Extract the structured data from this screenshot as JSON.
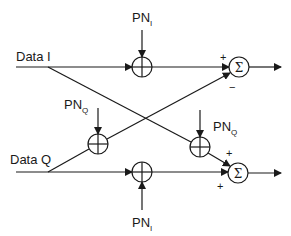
{
  "diagram": {
    "inputs": {
      "data_i": "Data I",
      "data_q": "Data Q"
    },
    "pn_labels": {
      "top_pn_i": {
        "main": "PN",
        "sub": "I"
      },
      "bottom_pn_i": {
        "main": "PN",
        "sub": "I"
      },
      "left_pn_q": {
        "main": "PN",
        "sub": "Q"
      },
      "right_pn_q": {
        "main": "PN",
        "sub": "Q"
      }
    },
    "summers": {
      "top": {
        "symbol": "Σ",
        "sign_upper": "+",
        "sign_lower": "−"
      },
      "bottom": {
        "symbol": "Σ",
        "sign_upper": "+",
        "sign_lower": "+"
      }
    },
    "line_color": "#1a1a1a",
    "background": "#ffffff"
  }
}
